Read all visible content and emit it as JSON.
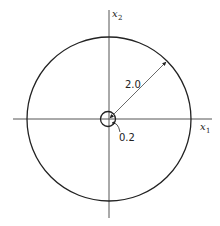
{
  "diagram": {
    "type": "concentric-circles",
    "axes": {
      "x_label": "x",
      "x_subscript": "1",
      "y_label": "x",
      "y_subscript": "2"
    },
    "outer_circle": {
      "radius_label": "2.0"
    },
    "inner_circle": {
      "radius_label": "0.2"
    },
    "colors": {
      "stroke": "#222222",
      "axis": "#555555",
      "background": "#ffffff"
    }
  }
}
